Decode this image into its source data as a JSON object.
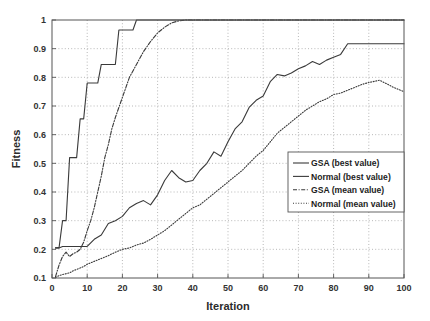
{
  "chart_data": {
    "type": "line",
    "title": "",
    "xlabel": "Iteration",
    "ylabel": "Fitness",
    "xlim": [
      0,
      100
    ],
    "ylim": [
      0.1,
      1
    ],
    "xticks": [
      0,
      10,
      20,
      30,
      40,
      50,
      60,
      70,
      80,
      90,
      100
    ],
    "xtick_labels": [
      "0",
      "10",
      "20",
      "30",
      "40",
      "50",
      "60",
      "70",
      "80",
      "90",
      "100"
    ],
    "yticks": [
      0.1,
      0.2,
      0.3,
      0.4,
      0.5,
      0.6,
      0.7,
      0.8,
      0.9,
      1
    ],
    "ytick_labels": [
      "0.1",
      "0.2",
      "0.3",
      "0.4",
      "0.5",
      "0.6",
      "0.7",
      "0.8",
      "0.9",
      "1"
    ],
    "grid": true,
    "grid_style": "dotted",
    "legend_position": "center-right",
    "line_color": "#3a3a3a",
    "series": [
      {
        "name": "GSA (best value)",
        "style": "solid",
        "x": [
          1,
          2,
          3,
          4,
          5,
          6,
          7,
          8,
          9,
          10,
          11,
          12,
          13,
          14,
          15,
          16,
          17,
          18,
          19,
          20,
          21,
          22,
          23,
          24,
          25,
          26,
          27,
          28,
          29,
          30,
          35,
          40,
          45,
          50,
          55,
          60,
          65,
          70,
          75,
          80,
          85,
          90,
          95,
          100
        ],
        "values": [
          0.205,
          0.205,
          0.3,
          0.3,
          0.52,
          0.52,
          0.52,
          0.655,
          0.655,
          0.78,
          0.78,
          0.78,
          0.78,
          0.845,
          0.845,
          0.845,
          0.845,
          0.845,
          0.965,
          0.965,
          0.965,
          0.965,
          0.965,
          1.0,
          1.0,
          1.0,
          1.0,
          1.0,
          1.0,
          1.0,
          1.0,
          1.0,
          1.0,
          1.0,
          1.0,
          1.0,
          1.0,
          1.0,
          1.0,
          1.0,
          1.0,
          1.0,
          1.0,
          1.0
        ]
      },
      {
        "name": "Normal (best value)",
        "style": "solid",
        "x": [
          1,
          2,
          3,
          4,
          5,
          6,
          7,
          8,
          9,
          10,
          12,
          14,
          16,
          18,
          20,
          22,
          24,
          26,
          28,
          30,
          32,
          34,
          36,
          38,
          40,
          42,
          44,
          46,
          48,
          50,
          52,
          54,
          56,
          58,
          60,
          62,
          64,
          66,
          68,
          70,
          72,
          74,
          76,
          78,
          80,
          82,
          84,
          86,
          88,
          90,
          92,
          94,
          96,
          98,
          100
        ],
        "values": [
          0.205,
          0.205,
          0.21,
          0.21,
          0.21,
          0.21,
          0.21,
          0.21,
          0.21,
          0.21,
          0.235,
          0.25,
          0.29,
          0.3,
          0.315,
          0.345,
          0.36,
          0.37,
          0.355,
          0.39,
          0.44,
          0.475,
          0.45,
          0.435,
          0.44,
          0.475,
          0.5,
          0.54,
          0.525,
          0.575,
          0.62,
          0.645,
          0.695,
          0.72,
          0.735,
          0.785,
          0.81,
          0.805,
          0.815,
          0.83,
          0.84,
          0.855,
          0.845,
          0.86,
          0.87,
          0.88,
          0.917,
          0.917,
          0.917,
          0.917,
          0.917,
          0.917,
          0.917,
          0.917,
          0.917
        ]
      },
      {
        "name": "GSA (mean value)",
        "style": "dash-dot",
        "x": [
          1,
          2,
          3,
          4,
          5,
          6,
          7,
          8,
          9,
          10,
          11,
          12,
          13,
          14,
          15,
          16,
          17,
          18,
          19,
          20,
          22,
          24,
          26,
          28,
          30,
          32,
          34,
          36,
          38,
          40,
          45,
          50,
          55,
          60,
          65,
          70,
          75,
          80,
          85,
          90,
          95,
          100
        ],
        "values": [
          0.105,
          0.145,
          0.175,
          0.19,
          0.175,
          0.185,
          0.19,
          0.2,
          0.225,
          0.265,
          0.3,
          0.345,
          0.4,
          0.455,
          0.52,
          0.565,
          0.62,
          0.66,
          0.695,
          0.73,
          0.8,
          0.845,
          0.89,
          0.925,
          0.955,
          0.975,
          0.99,
          0.997,
          1.0,
          1.0,
          1.0,
          1.0,
          1.0,
          1.0,
          1.0,
          1.0,
          1.0,
          1.0,
          1.0,
          1.0,
          1.0,
          1.0
        ]
      },
      {
        "name": "Normal (mean value)",
        "style": "dotted",
        "x": [
          1,
          2,
          3,
          4,
          5,
          6,
          7,
          8,
          9,
          10,
          12,
          14,
          16,
          18,
          20,
          22,
          24,
          26,
          28,
          30,
          32,
          34,
          36,
          38,
          40,
          42,
          44,
          46,
          48,
          50,
          52,
          54,
          56,
          58,
          60,
          62,
          64,
          66,
          68,
          70,
          72,
          74,
          76,
          78,
          80,
          82,
          84,
          86,
          88,
          90,
          92,
          93,
          95,
          97,
          100
        ],
        "values": [
          0.102,
          0.108,
          0.112,
          0.115,
          0.118,
          0.125,
          0.13,
          0.135,
          0.14,
          0.148,
          0.158,
          0.168,
          0.178,
          0.19,
          0.2,
          0.205,
          0.215,
          0.222,
          0.235,
          0.25,
          0.265,
          0.285,
          0.305,
          0.325,
          0.345,
          0.355,
          0.375,
          0.395,
          0.415,
          0.435,
          0.455,
          0.475,
          0.5,
          0.525,
          0.545,
          0.575,
          0.605,
          0.625,
          0.645,
          0.665,
          0.685,
          0.7,
          0.715,
          0.725,
          0.74,
          0.745,
          0.755,
          0.765,
          0.775,
          0.782,
          0.787,
          0.79,
          0.778,
          0.765,
          0.75
        ]
      }
    ]
  },
  "legend": {
    "entries": [
      {
        "label": "GSA (best value)"
      },
      {
        "label": "Normal (best value)"
      },
      {
        "label": "GSA (mean value)"
      },
      {
        "label": "Normal (mean value)"
      }
    ]
  }
}
